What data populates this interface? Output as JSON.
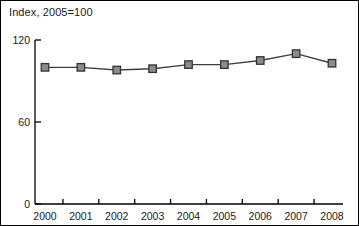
{
  "chart_data": {
    "type": "line",
    "title": "Index, 2005=100",
    "xlabel": "",
    "ylabel": "",
    "categories": [
      "2000",
      "2001",
      "2002",
      "2003",
      "2004",
      "2005",
      "2006",
      "2007",
      "2008"
    ],
    "values": [
      100,
      100,
      98,
      99,
      102,
      102,
      105,
      110,
      103
    ],
    "series": [
      {
        "name": "Index",
        "values": [
          100,
          100,
          98,
          99,
          102,
          102,
          105,
          110,
          103
        ]
      }
    ],
    "ylim": [
      0,
      120
    ],
    "yticks": [
      0,
      60,
      120
    ],
    "ytick_labels": [
      "0",
      "60",
      "120"
    ],
    "xtick_labels": [
      "2000",
      "2001",
      "2002",
      "2003",
      "2004",
      "2005",
      "2006",
      "2007",
      "2008"
    ],
    "grid": false,
    "legend": "none",
    "marker": "square",
    "marker_color": "#8c8c8c",
    "marker_edge_color": "#333333",
    "line_color": "#404040",
    "axis_color": "#000000",
    "border_color": "#000000"
  },
  "axes": {
    "y_title": "",
    "x_title": ""
  }
}
